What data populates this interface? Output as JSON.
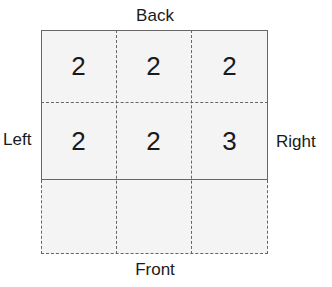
{
  "labels": {
    "back": "Back",
    "left": "Left",
    "right": "Right",
    "front": "Front"
  },
  "grid": {
    "rows": [
      [
        "2",
        "2",
        "2"
      ],
      [
        "2",
        "2",
        "3"
      ],
      [
        "",
        "",
        ""
      ]
    ],
    "line_color": "#666666",
    "cell_fill": "#f4f4f4"
  }
}
